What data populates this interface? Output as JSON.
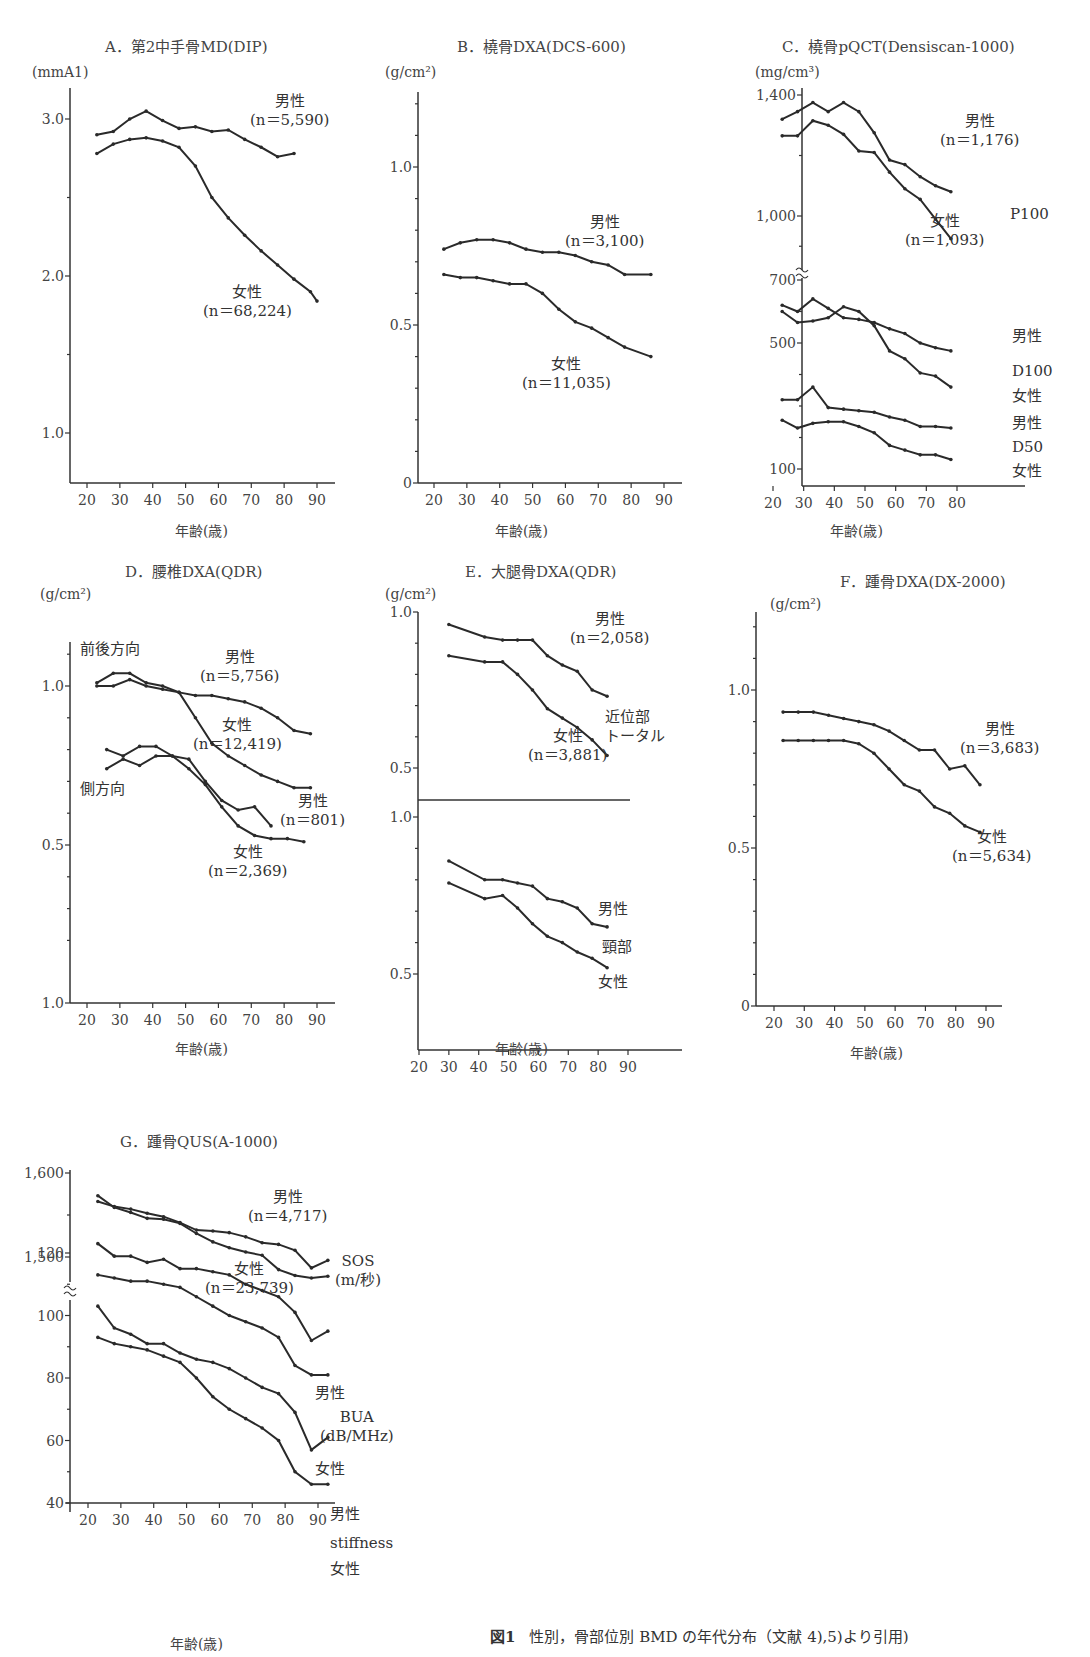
{
  "figure_caption": {
    "number": "図1",
    "text": "性別，骨部位別 BMD の年代分布（文献 4),5)より引用)"
  },
  "common": {
    "xlabel": "年齢(歳)",
    "male": "男性",
    "female": "女性"
  },
  "chart_data": [
    {
      "id": "A",
      "type": "line",
      "title": "A．第2中手骨MD(DIP)",
      "ylabel": "(mmA1)",
      "xlabel": "年齢(歳)",
      "xticks": [
        20,
        30,
        40,
        50,
        60,
        70,
        80,
        90
      ],
      "yticks": [
        1.0,
        2.0,
        3.0
      ],
      "ylim": [
        0.7,
        3.4
      ],
      "series": [
        {
          "name": "男性",
          "n": "n＝5,590",
          "x": [
            23,
            28,
            33,
            38,
            43,
            48,
            53,
            58,
            63,
            68,
            73,
            78,
            83
          ],
          "values": [
            2.9,
            2.92,
            3.0,
            3.05,
            2.99,
            2.94,
            2.95,
            2.92,
            2.93,
            2.87,
            2.82,
            2.76,
            2.78
          ]
        },
        {
          "name": "女性",
          "n": "n＝68,224",
          "x": [
            23,
            28,
            33,
            38,
            43,
            48,
            53,
            58,
            63,
            68,
            73,
            78,
            83,
            88,
            90
          ],
          "values": [
            2.78,
            2.84,
            2.87,
            2.88,
            2.86,
            2.82,
            2.7,
            2.5,
            2.37,
            2.26,
            2.16,
            2.07,
            1.98,
            1.9,
            1.84
          ]
        }
      ]
    },
    {
      "id": "B",
      "type": "line",
      "title": "B．橈骨DXA(DCS-600)",
      "ylabel": "(g/cm²)",
      "xlabel": "年齢(歳)",
      "xticks": [
        20,
        30,
        40,
        50,
        60,
        70,
        80,
        90
      ],
      "yticks": [
        0,
        0.5,
        1.0
      ],
      "ylim": [
        0,
        1.25
      ],
      "series": [
        {
          "name": "男性",
          "n": "n＝3,100",
          "x": [
            23,
            28,
            33,
            38,
            43,
            48,
            53,
            58,
            63,
            68,
            73,
            78,
            86
          ],
          "values": [
            0.74,
            0.76,
            0.77,
            0.77,
            0.76,
            0.74,
            0.73,
            0.73,
            0.72,
            0.7,
            0.69,
            0.66,
            0.66
          ]
        },
        {
          "name": "女性",
          "n": "n＝11,035",
          "x": [
            23,
            28,
            33,
            38,
            43,
            48,
            53,
            58,
            63,
            68,
            73,
            78,
            86
          ],
          "values": [
            0.66,
            0.65,
            0.65,
            0.64,
            0.63,
            0.63,
            0.6,
            0.55,
            0.51,
            0.49,
            0.46,
            0.43,
            0.4
          ]
        }
      ]
    },
    {
      "id": "C",
      "type": "line",
      "title": "C．橈骨pQCT(Densiscan-1000)",
      "ylabel": "(mg/cm³)",
      "xlabel": "年齢(歳)",
      "xticks": [
        20,
        30,
        40,
        50,
        60,
        70,
        80
      ],
      "yticks_upper": [
        "1,000",
        "1,400"
      ],
      "yticks_lower": [
        "100",
        "500",
        "700"
      ],
      "series": [
        {
          "name": "男性 P100",
          "n": "n＝1,176",
          "x": [
            23,
            28,
            33,
            38,
            43,
            48,
            53,
            58,
            63,
            68,
            73,
            78
          ],
          "values": [
            1320,
            1345,
            1375,
            1345,
            1375,
            1345,
            1275,
            1185,
            1170,
            1130,
            1100,
            1080
          ]
        },
        {
          "name": "女性 P100",
          "n": "n＝1,093",
          "x": [
            23,
            28,
            33,
            38,
            43,
            48,
            53,
            58,
            63,
            68,
            73,
            78
          ],
          "values": [
            1265,
            1265,
            1315,
            1300,
            1270,
            1215,
            1210,
            1145,
            1090,
            1055,
            990,
            925
          ]
        },
        {
          "name": "男性 D100",
          "x": [
            23,
            28,
            33,
            38,
            43,
            48,
            53,
            58,
            63,
            68,
            73,
            78
          ],
          "values": [
            620,
            600,
            640,
            610,
            580,
            575,
            565,
            545,
            530,
            500,
            485,
            475
          ]
        },
        {
          "name": "女性 D100",
          "x": [
            23,
            28,
            33,
            38,
            43,
            48,
            53,
            58,
            63,
            68,
            73,
            78
          ],
          "values": [
            600,
            565,
            570,
            580,
            615,
            600,
            555,
            475,
            450,
            405,
            395,
            360
          ]
        },
        {
          "name": "男性 D50",
          "x": [
            23,
            28,
            33,
            38,
            43,
            48,
            53,
            58,
            63,
            68,
            73,
            78
          ],
          "values": [
            320,
            320,
            360,
            295,
            290,
            285,
            280,
            265,
            255,
            235,
            235,
            230
          ]
        },
        {
          "name": "女性 D50",
          "x": [
            23,
            28,
            33,
            38,
            43,
            48,
            53,
            58,
            63,
            68,
            73,
            78
          ],
          "values": [
            255,
            230,
            245,
            250,
            250,
            235,
            215,
            175,
            160,
            145,
            145,
            130
          ]
        }
      ],
      "annotations": [
        "P100",
        "D100",
        "D50"
      ]
    },
    {
      "id": "D",
      "type": "line",
      "title": "D．腰椎DXA(QDR)",
      "ylabel": "(g/cm²)",
      "xlabel": "年齢(歳)",
      "xticks": [
        20,
        30,
        40,
        50,
        60,
        70,
        80,
        90
      ],
      "yticks": [
        "1.0",
        "0.5",
        "1.0"
      ],
      "series": [
        {
          "name": "男性 前後方向",
          "n": "n＝5,756",
          "x": [
            23,
            28,
            33,
            38,
            43,
            48,
            53,
            58,
            63,
            68,
            73,
            78,
            83,
            88
          ],
          "values": [
            1.0,
            1.0,
            1.02,
            1.0,
            0.99,
            0.98,
            0.97,
            0.97,
            0.96,
            0.95,
            0.93,
            0.9,
            0.86,
            0.85
          ]
        },
        {
          "name": "女性 前後方向",
          "n": "n＝12,419",
          "x": [
            23,
            28,
            33,
            38,
            43,
            48,
            53,
            58,
            63,
            68,
            73,
            78,
            83,
            88
          ],
          "values": [
            1.01,
            1.04,
            1.04,
            1.01,
            1.0,
            0.98,
            0.9,
            0.82,
            0.78,
            0.75,
            0.72,
            0.7,
            0.68,
            0.68
          ]
        },
        {
          "name": "男性 側方向",
          "n": "n＝801",
          "x": [
            26,
            31,
            36,
            41,
            46,
            51,
            56,
            61,
            66,
            71,
            76
          ],
          "values": [
            0.74,
            0.77,
            0.75,
            0.78,
            0.78,
            0.77,
            0.7,
            0.64,
            0.61,
            0.62,
            0.56
          ]
        },
        {
          "name": "女性 側方向",
          "n": "n＝2,369",
          "x": [
            26,
            31,
            36,
            41,
            46,
            51,
            56,
            61,
            66,
            71,
            76,
            81,
            86
          ],
          "values": [
            0.8,
            0.78,
            0.81,
            0.81,
            0.78,
            0.74,
            0.69,
            0.62,
            0.56,
            0.53,
            0.52,
            0.52,
            0.51
          ]
        }
      ],
      "annotations": [
        "前後方向",
        "側方向"
      ]
    },
    {
      "id": "E",
      "type": "line",
      "title": "E．大腿骨DXA(QDR)",
      "ylabel": "(g/cm²)",
      "xlabel": "年齢(歳)",
      "xticks": [
        20,
        30,
        40,
        50,
        60,
        70,
        80,
        90
      ],
      "yticks_upper": [
        "0.5",
        "1.0"
      ],
      "yticks_lower": [
        "0.5",
        "1.0"
      ],
      "series": [
        {
          "name": "男性 近位部トータル",
          "n": "n＝2,058",
          "x": [
            30,
            42,
            48,
            53,
            58,
            63,
            68,
            73,
            78,
            83
          ],
          "values": [
            0.96,
            0.92,
            0.91,
            0.91,
            0.91,
            0.86,
            0.83,
            0.81,
            0.75,
            0.73
          ]
        },
        {
          "name": "女性 近位部トータル",
          "n": "n＝3,881",
          "x": [
            30,
            42,
            48,
            53,
            58,
            63,
            68,
            73,
            78,
            83
          ],
          "values": [
            0.86,
            0.84,
            0.84,
            0.8,
            0.75,
            0.69,
            0.66,
            0.63,
            0.59,
            0.54
          ]
        },
        {
          "name": "男性 頸部",
          "x": [
            30,
            42,
            48,
            53,
            58,
            63,
            68,
            73,
            78,
            83
          ],
          "values": [
            0.86,
            0.8,
            0.8,
            0.79,
            0.78,
            0.74,
            0.73,
            0.71,
            0.66,
            0.65
          ]
        },
        {
          "name": "女性 頸部",
          "x": [
            30,
            42,
            48,
            53,
            58,
            63,
            68,
            73,
            78,
            83
          ],
          "values": [
            0.79,
            0.74,
            0.75,
            0.71,
            0.66,
            0.62,
            0.6,
            0.57,
            0.55,
            0.52
          ]
        }
      ],
      "annotations": [
        "近位部",
        "トータル",
        "頸部"
      ]
    },
    {
      "id": "F",
      "type": "line",
      "title": "F．踵骨DXA(DX-2000)",
      "ylabel": "(g/cm²)",
      "xlabel": "年齢(歳)",
      "xticks": [
        20,
        30,
        40,
        50,
        60,
        70,
        80,
        90
      ],
      "yticks": [
        0,
        0.5,
        1.0
      ],
      "ylim": [
        0,
        1.25
      ],
      "series": [
        {
          "name": "男性",
          "n": "n＝3,683",
          "x": [
            23,
            28,
            33,
            38,
            43,
            48,
            53,
            58,
            63,
            68,
            73,
            78,
            83,
            88
          ],
          "values": [
            0.93,
            0.93,
            0.93,
            0.92,
            0.91,
            0.9,
            0.89,
            0.87,
            0.84,
            0.81,
            0.81,
            0.75,
            0.76,
            0.7
          ]
        },
        {
          "name": "女性",
          "n": "n＝5,634",
          "x": [
            23,
            28,
            33,
            38,
            43,
            48,
            53,
            58,
            63,
            68,
            73,
            78,
            83,
            88
          ],
          "values": [
            0.84,
            0.84,
            0.84,
            0.84,
            0.84,
            0.83,
            0.8,
            0.75,
            0.7,
            0.68,
            0.63,
            0.61,
            0.57,
            0.55
          ]
        }
      ]
    },
    {
      "id": "G",
      "type": "line",
      "title": "G．踵骨QUS(A-1000)",
      "xlabel": "年齢(歳)",
      "xticks": [
        20,
        30,
        40,
        50,
        60,
        70,
        80,
        90
      ],
      "yticks_upper": [
        "1,500",
        "1,600"
      ],
      "yticks_lower": [
        "40",
        "60",
        "80",
        "100",
        "120"
      ],
      "series": [
        {
          "name": "男性 SOS",
          "n": "n＝4,717",
          "x": [
            23,
            28,
            33,
            38,
            43,
            48,
            53,
            58,
            63,
            68,
            73,
            78,
            83,
            88,
            93
          ],
          "values": [
            1566,
            1560,
            1557,
            1552,
            1548,
            1541,
            1532,
            1531,
            1529,
            1524,
            1517,
            1515,
            1508,
            1487,
            1496
          ]
        },
        {
          "name": "女性 SOS",
          "n": "n＝23,739",
          "x": [
            23,
            28,
            33,
            38,
            43,
            48,
            53,
            58,
            63,
            68,
            73,
            78,
            83,
            88,
            93
          ],
          "values": [
            1573,
            1559,
            1553,
            1546,
            1545,
            1540,
            1528,
            1518,
            1511,
            1506,
            1502,
            1485,
            1478,
            1475,
            1477
          ]
        },
        {
          "name": "男性 BUA",
          "x": [
            23,
            28,
            33,
            38,
            43,
            48,
            53,
            58,
            63,
            68,
            73,
            78,
            83,
            88,
            93
          ],
          "values": [
            123,
            119,
            119,
            117,
            118,
            115,
            115,
            114,
            113,
            110,
            108,
            106,
            101,
            92,
            95
          ]
        },
        {
          "name": "女性 BUA",
          "x": [
            23,
            28,
            33,
            38,
            43,
            48,
            53,
            58,
            63,
            68,
            73,
            78,
            83,
            88,
            93
          ],
          "values": [
            113,
            112,
            111,
            111,
            110,
            109,
            106,
            103,
            100,
            98,
            96,
            93,
            84,
            81,
            81
          ]
        },
        {
          "name": "男性 stiffness",
          "x": [
            23,
            28,
            33,
            38,
            43,
            48,
            53,
            58,
            63,
            68,
            73,
            78,
            83,
            88,
            93
          ],
          "values": [
            103,
            96,
            94,
            91,
            91,
            88,
            86,
            85,
            83,
            80,
            77,
            75,
            69,
            57,
            61
          ]
        },
        {
          "name": "女性 stiffness",
          "x": [
            23,
            28,
            33,
            38,
            43,
            48,
            53,
            58,
            63,
            68,
            73,
            78,
            83,
            88,
            93
          ],
          "values": [
            93,
            91,
            90,
            89,
            87,
            85,
            80,
            74,
            70,
            67,
            64,
            60,
            50,
            46,
            46
          ]
        }
      ],
      "annotations": [
        "SOS",
        "(m/秒)",
        "BUA",
        "(dB/MHz)",
        "stiffness"
      ]
    }
  ]
}
